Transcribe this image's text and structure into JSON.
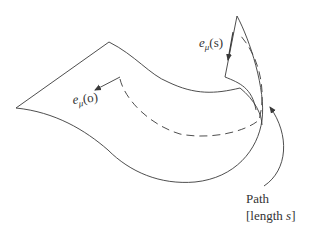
{
  "diagram": {
    "colors": {
      "stroke": "#3a3a3a",
      "text": "#333333",
      "background": "#ffffff"
    },
    "labels": {
      "vector_start": {
        "base": "e",
        "sub": "μ",
        "arg": "(o)"
      },
      "vector_end": {
        "base": "e",
        "sub": "μ",
        "arg": "(s)"
      },
      "path_line1": "Path",
      "path_line2_prefix": "[length ",
      "path_line2_var": "s",
      "path_line2_suffix": "]"
    },
    "elements": [
      {
        "id": "surface",
        "type": "curved-sheet"
      },
      {
        "id": "path",
        "type": "dashed-curve"
      },
      {
        "id": "vector-start",
        "type": "arrow",
        "label": "e_μ(o)"
      },
      {
        "id": "vector-end",
        "type": "arrow",
        "label": "e_μ(s)"
      },
      {
        "id": "path-pointer",
        "type": "curved-arrow",
        "label": "Path [length s]"
      }
    ]
  }
}
